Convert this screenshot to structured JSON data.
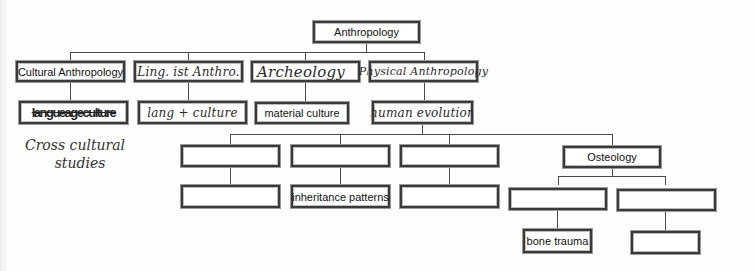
{
  "diagram": {
    "type": "concept-map / hierarchy chart",
    "root": {
      "label": "Anthropology",
      "style": "printed"
    },
    "level1": [
      {
        "label": "Cultural Anthropology",
        "style": "printed"
      },
      {
        "label": "Linguistic Anthro.",
        "style": "handwritten",
        "raw": "Ling. ist Anthro."
      },
      {
        "label": "Archeology",
        "style": "handwritten",
        "raw": "Archeology"
      },
      {
        "label": "Physical Anthropology",
        "style": "handwritten",
        "raw": "Physical Anthropology"
      }
    ],
    "level2": [
      {
        "label": "language/culture (scribbled out)",
        "style": "handwritten-scribbled",
        "parent": "Cultural Anthropology"
      },
      {
        "label": "lang + culture",
        "style": "handwritten",
        "parent": "Linguistic Anthro."
      },
      {
        "label": "material culture",
        "style": "printed",
        "parent": "Archeology"
      },
      {
        "label": "human evolution",
        "style": "handwritten",
        "parent": "Physical Anthropology"
      }
    ],
    "annotation": {
      "label_line1": "Cross cultural",
      "label_line2": "studies",
      "style": "handwritten"
    },
    "level3": [
      {
        "label": "",
        "parent": "human evolution"
      },
      {
        "label": "",
        "parent": "human evolution"
      },
      {
        "label": "",
        "parent": "human evolution"
      },
      {
        "label": "Osteology",
        "style": "printed",
        "parent": "human evolution"
      }
    ],
    "level4": [
      {
        "label": ""
      },
      {
        "label": "inheritance patterns",
        "style": "printed"
      },
      {
        "label": ""
      },
      {
        "label": "",
        "parent": "Osteology"
      },
      {
        "label": "",
        "parent": "Osteology"
      }
    ],
    "level5": [
      {
        "label": "bone trauma",
        "style": "printed"
      },
      {
        "label": ""
      }
    ]
  },
  "display": {
    "root": "Anthropology",
    "l1_cultural": "Cultural Anthropology",
    "l1_linguistic": "Ling. ist Anthro.",
    "l1_archeology": "Archeology",
    "l1_physical": "Physical Anthropology",
    "l2_scribble": "langueageculture",
    "l2_lang": "lang + culture",
    "l2_material": "material culture",
    "l2_human": "human evolution",
    "note_1": "Cross cultural",
    "note_2": "studies",
    "l3_osteology": "Osteology",
    "l4_inheritance": "inheritance patterns",
    "l5_bone": "bone trauma"
  },
  "colors": {
    "line": "#4a4a4a",
    "box_border": "#3a3a3a",
    "background": "#fdfdfc"
  }
}
